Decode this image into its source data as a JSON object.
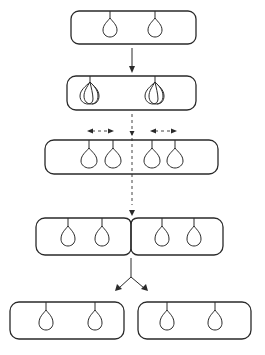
{
  "diagram": {
    "stroke_color": "#2a2a2a",
    "background": "#ffffff",
    "stages": [
      {
        "id": "stage-1",
        "label": "Parent cell with two attached chromosomes",
        "cells": 1,
        "chromosomes": 2
      },
      {
        "id": "stage-2",
        "label": "Chromosomes replicate (doubled outlines)",
        "cells": 1,
        "chromosomes": 2,
        "replicated": true
      },
      {
        "id": "stage-3",
        "label": "Cell elongates, daughter chromosomes separate",
        "cells": 1,
        "chromosomes": 4
      },
      {
        "id": "stage-4",
        "label": "Septum forms dividing the cell",
        "cells": 2,
        "chromosomes": 4
      },
      {
        "id": "stage-5",
        "label": "Two daughter cells",
        "cells": 2,
        "chromosomes": 4
      }
    ],
    "connectors": [
      {
        "from": "stage-1",
        "to": "stage-2",
        "type": "arrow"
      },
      {
        "from": "stage-2",
        "to": "stage-4",
        "type": "dashed-division-line"
      },
      {
        "from": "stage-4",
        "to": "stage-5",
        "type": "split-arrow"
      }
    ],
    "annotations": [
      "double-headed dashed arrow (left pair)",
      "double-headed dashed arrow (right pair)"
    ]
  }
}
